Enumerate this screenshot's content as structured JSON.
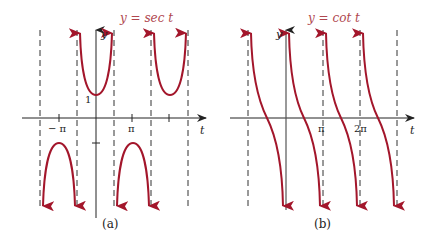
{
  "panels": [
    {
      "id": "a",
      "title": "y  =  sec t",
      "caption": "(a)",
      "y_axis_label": "y",
      "x_axis_label": "t",
      "tick_labels": [
        "− π",
        "π"
      ],
      "y_tick_label": "1"
    },
    {
      "id": "b",
      "title": "y  =  cot t",
      "caption": "(b)",
      "y_axis_label": "y",
      "x_axis_label": "t",
      "tick_labels": [
        "π",
        "2π"
      ]
    }
  ],
  "colors": {
    "curve": "#a3162b",
    "title": "#b0474f",
    "axis": "#222222",
    "asymptote": "#333333"
  }
}
